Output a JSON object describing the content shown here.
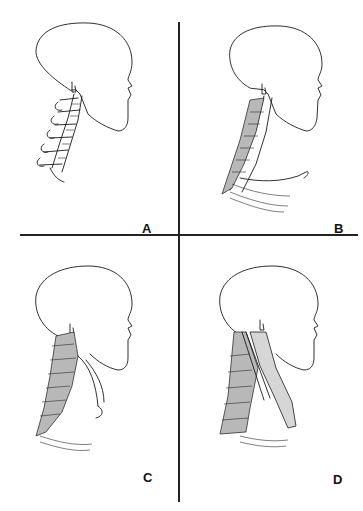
{
  "figure": {
    "panels": [
      {
        "id": "A",
        "label": "A",
        "description": "Skull with cervical vertebrae"
      },
      {
        "id": "B",
        "label": "B",
        "description": "Skull with deep neck muscles and clavicle"
      },
      {
        "id": "C",
        "label": "C",
        "description": "Head with intermediate neck muscle layer"
      },
      {
        "id": "D",
        "label": "D",
        "description": "Head with superficial neck muscles"
      }
    ]
  },
  "colors": {
    "line": "#1a1a1a",
    "background": "#ffffff",
    "shading": "#b8b8b8"
  }
}
